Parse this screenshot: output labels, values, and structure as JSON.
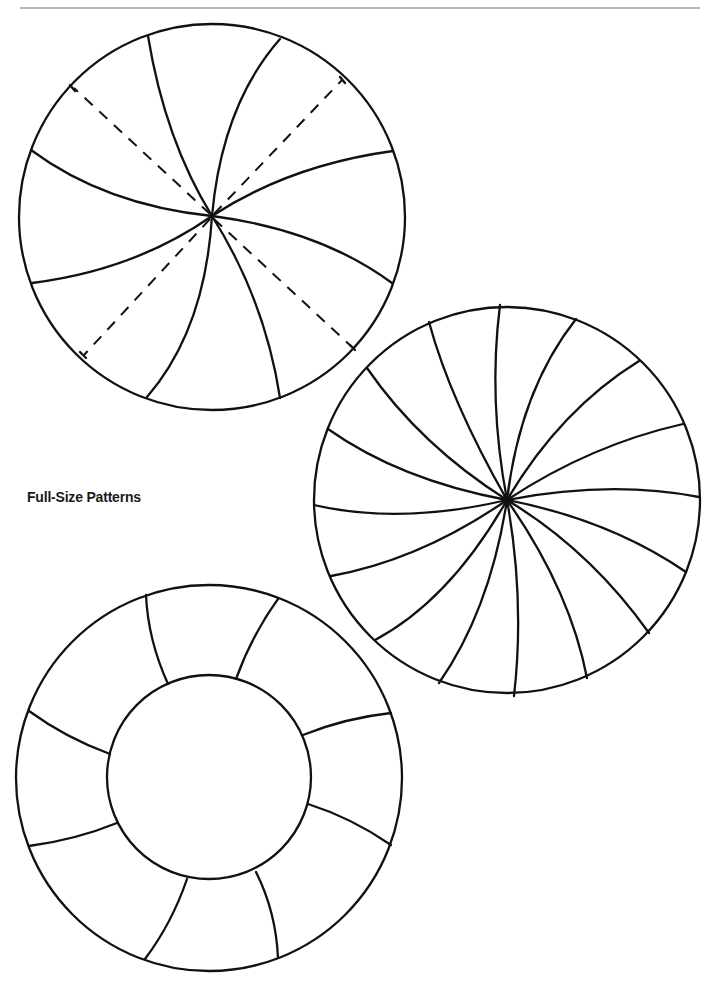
{
  "page": {
    "section_label": "Full-Size Patterns"
  },
  "patterns": [
    {
      "name": "eight-segment swirl with dashed guides",
      "segments": 8,
      "dashed_guides": 4
    },
    {
      "name": "sixteen-segment swirl",
      "segments": 16
    },
    {
      "name": "ring with eight segments",
      "segments": 8,
      "has_center_circle": true
    }
  ],
  "colors": {
    "line": "#111111",
    "rule": "#b8b8b8",
    "background": "#ffffff"
  }
}
